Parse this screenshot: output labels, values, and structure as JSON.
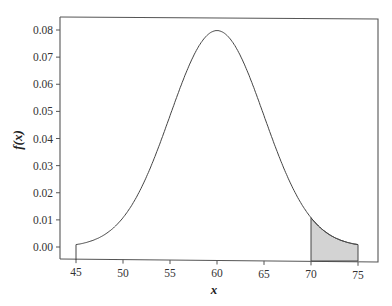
{
  "chart_data": {
    "type": "area",
    "title": "",
    "xlabel": "x",
    "ylabel": "f(x)",
    "distribution": {
      "name": "normal",
      "mean": 60,
      "sd": 5
    },
    "xlim": [
      43.5,
      76.7
    ],
    "ylim": [
      -0.004,
      0.0835
    ],
    "x_ticks": [
      45,
      50,
      55,
      60,
      65,
      70,
      75
    ],
    "x_tick_labels": [
      "45",
      "50",
      "55",
      "60",
      "65",
      "70",
      "75"
    ],
    "y_ticks": [
      0.0,
      0.01,
      0.02,
      0.03,
      0.04,
      0.05,
      0.06,
      0.07,
      0.08
    ],
    "y_tick_labels": [
      "0.00",
      "0.01",
      "0.02",
      "0.03",
      "0.04",
      "0.05",
      "0.06",
      "0.07",
      "0.08"
    ],
    "grid": false,
    "legend": null,
    "series": [
      {
        "name": "f(x)",
        "x": [
          45,
          46,
          47,
          48,
          49,
          50,
          51,
          52,
          53,
          54,
          55,
          56,
          57,
          58,
          59,
          60,
          61,
          62,
          63,
          64,
          65,
          66,
          67,
          68,
          69,
          70,
          71,
          72,
          73,
          74,
          75
        ],
        "values": [
          0.0009,
          0.0016,
          0.0027,
          0.0044,
          0.0071,
          0.0108,
          0.0158,
          0.0222,
          0.0299,
          0.0388,
          0.0484,
          0.0579,
          0.0666,
          0.0737,
          0.0782,
          0.0798,
          0.0782,
          0.0737,
          0.0666,
          0.0579,
          0.0484,
          0.0388,
          0.0299,
          0.0222,
          0.0158,
          0.0108,
          0.0071,
          0.0044,
          0.0027,
          0.0016,
          0.0009
        ]
      }
    ],
    "shaded_region": {
      "x_from": 70,
      "x_to": 75,
      "color": "#d3d3d3"
    },
    "colors": {
      "line": "#444444",
      "axis": "#555555",
      "shade": "#d3d3d3"
    }
  }
}
